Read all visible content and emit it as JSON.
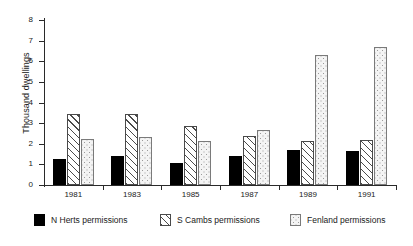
{
  "chart_data": {
    "type": "bar",
    "title": "",
    "xlabel": "",
    "ylabel": "Thousand dwellings",
    "categories": [
      "1981",
      "1983",
      "1985",
      "1987",
      "1989",
      "1991"
    ],
    "series": [
      {
        "name": "N Herts permissions",
        "pattern": "solid-black",
        "values": [
          1.25,
          1.4,
          1.05,
          1.4,
          1.7,
          1.65
        ]
      },
      {
        "name": "S Cambs permissions",
        "pattern": "diagonal-hatch",
        "values": [
          3.45,
          3.45,
          2.85,
          2.4,
          2.15,
          2.2
        ]
      },
      {
        "name": "Fenland permissions",
        "pattern": "dotted",
        "values": [
          2.25,
          2.35,
          2.15,
          2.65,
          6.3,
          6.7
        ]
      }
    ],
    "ylim": [
      0,
      8
    ],
    "yticks": [
      "0",
      "1",
      "2",
      "3",
      "4",
      "5",
      "6",
      "7",
      "8"
    ],
    "grid": false,
    "legend_position": "bottom"
  },
  "legend": {
    "items": [
      {
        "label": "N Herts permissions"
      },
      {
        "label": "S Cambs permissions"
      },
      {
        "label": "Fenland permissions"
      }
    ]
  }
}
